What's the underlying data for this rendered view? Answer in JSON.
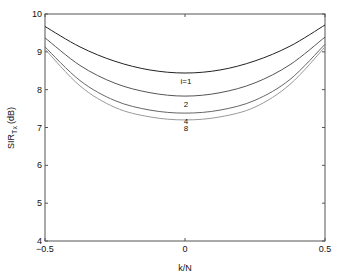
{
  "chart_data": {
    "type": "line",
    "title": "",
    "xlabel": "k/N",
    "ylabel_main": "SIR",
    "ylabel_sub": "Tx",
    "ylabel_unit": "(dB)",
    "xlim": [
      -0.5,
      0.5
    ],
    "ylim": [
      4,
      10
    ],
    "xticks": [
      -0.5,
      0,
      0.5
    ],
    "xtick_labels": [
      "-0.5",
      "0",
      "0.5"
    ],
    "yticks": [
      4,
      5,
      6,
      7,
      8,
      9,
      10
    ],
    "ytick_labels": [
      "4",
      "5",
      "6",
      "7",
      "8",
      "9",
      "10"
    ],
    "grid": false,
    "legend": "inline labels",
    "x": [
      -0.5,
      -0.375,
      -0.25,
      -0.125,
      0,
      0.125,
      0.25,
      0.375,
      0.5
    ],
    "series": [
      {
        "name": "i=1",
        "label": "i=1",
        "color": "#222222",
        "values": [
          9.67,
          9.13,
          8.75,
          8.52,
          8.44,
          8.52,
          8.76,
          9.15,
          9.71
        ]
      },
      {
        "name": "i=2",
        "label": "2",
        "color": "#555555",
        "values": [
          9.37,
          8.64,
          8.17,
          7.92,
          7.83,
          7.92,
          8.18,
          8.66,
          9.39
        ]
      },
      {
        "name": "i=4",
        "label": "4",
        "color": "#666666",
        "values": [
          9.13,
          8.24,
          7.71,
          7.46,
          7.38,
          7.46,
          7.72,
          8.27,
          9.2
        ]
      },
      {
        "name": "i=8",
        "label": "8",
        "color": "#999999",
        "values": [
          9.07,
          8.1,
          7.53,
          7.28,
          7.2,
          7.28,
          7.54,
          8.14,
          9.13
        ]
      }
    ]
  }
}
